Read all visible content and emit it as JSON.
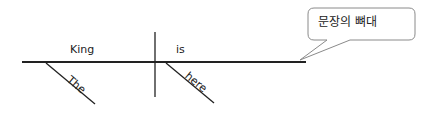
{
  "diagram": {
    "type": "sentence-diagram",
    "sentence_words": {
      "subject": "King",
      "verb": "is",
      "subject_modifier": "The",
      "verb_modifier": "here"
    },
    "callout": {
      "label": "문장의 뼈대"
    },
    "colors": {
      "line": "#222222",
      "callout_border": "#8a8a8a",
      "background": "#ffffff"
    }
  }
}
